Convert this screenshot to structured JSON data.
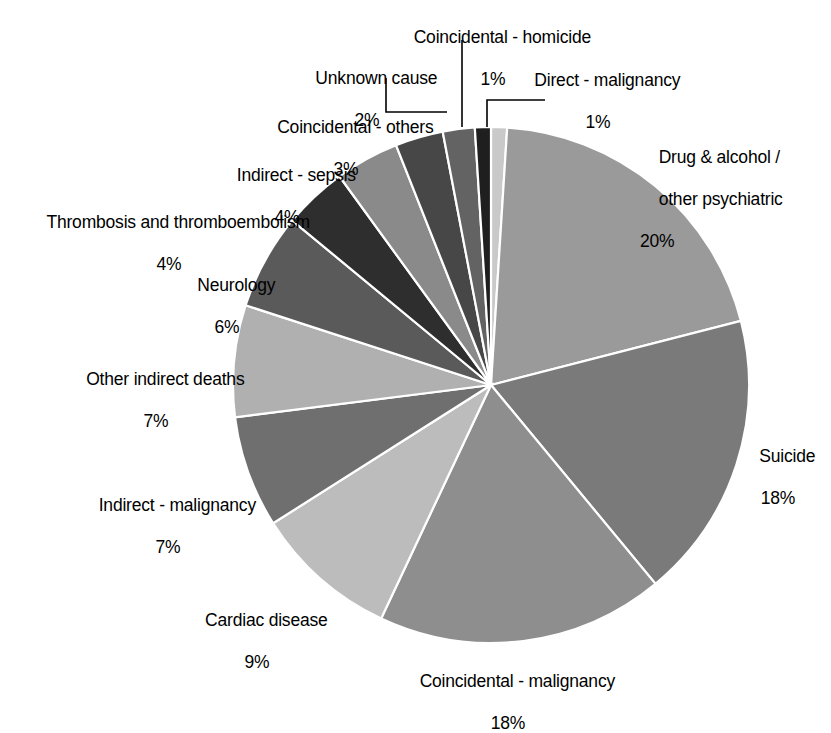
{
  "chart_data": {
    "type": "pie",
    "title": "",
    "legend_position": "none",
    "grid": false,
    "unit": "%",
    "total": 100,
    "start_angle_deg": 0,
    "direction": "clockwise",
    "categories": [
      "Direct - malignancy",
      "Drug & alcohol / other psychiatric",
      "Suicide",
      "Coincidental - malignancy",
      "Cardiac disease",
      "Indirect - malignancy",
      "Other indirect deaths",
      "Neurology",
      "Thrombosis and thromboembolism",
      "Indirect - sepsis",
      "Coincidental - others",
      "Unknown cause",
      "Coincidental - homicide"
    ],
    "values": [
      1,
      20,
      18,
      18,
      9,
      7,
      7,
      6,
      4,
      4,
      3,
      2,
      1
    ],
    "colors": [
      "#c9c9c9",
      "#9a9a9a",
      "#7a7a7a",
      "#8e8e8e",
      "#bcbcbc",
      "#6f6f6f",
      "#b0b0b0",
      "#5a5a5a",
      "#2e2e2e",
      "#8a8a8a",
      "#474747",
      "#636363",
      "#1f1f1f"
    ],
    "slice_labels": [
      {
        "name": "Direct - malignancy",
        "value": 1,
        "text": "Direct - malignancy",
        "pct": "1%"
      },
      {
        "name": "Drug & alcohol / other psychiatric",
        "value": 20,
        "text": "Drug & alcohol /\nother psychiatric",
        "pct": "20%"
      },
      {
        "name": "Suicide",
        "value": 18,
        "text": "Suicide",
        "pct": "18%"
      },
      {
        "name": "Coincidental - malignancy",
        "value": 18,
        "text": "Coincidental - malignancy",
        "pct": "18%"
      },
      {
        "name": "Cardiac disease",
        "value": 9,
        "text": "Cardiac disease",
        "pct": "9%"
      },
      {
        "name": "Indirect - malignancy",
        "value": 7,
        "text": "Indirect - malignancy",
        "pct": "7%"
      },
      {
        "name": "Other indirect deaths",
        "value": 7,
        "text": "Other indirect deaths",
        "pct": "7%"
      },
      {
        "name": "Neurology",
        "value": 6,
        "text": "Neurology",
        "pct": "6%"
      },
      {
        "name": "Thrombosis and thromboembolism",
        "value": 4,
        "text": "Thrombosis and thromboembolism",
        "pct": "4%"
      },
      {
        "name": "Indirect - sepsis",
        "value": 4,
        "text": "Indirect - sepsis",
        "pct": "4%"
      },
      {
        "name": "Coincidental - others",
        "value": 3,
        "text": "Coincidental - others",
        "pct": "3%"
      },
      {
        "name": "Unknown cause",
        "value": 2,
        "text": "Unknown cause",
        "pct": "2%"
      },
      {
        "name": "Coincidental - homicide",
        "value": 1,
        "text": "Coincidental - homicide",
        "pct": "1%"
      }
    ]
  },
  "labels": {
    "coincidental_homicide": {
      "text": "Coincidental - homicide",
      "pct": "1%"
    },
    "direct_malignancy": {
      "text": "Direct - malignancy",
      "pct": "1%"
    },
    "unknown_cause": {
      "text": "Unknown cause",
      "pct": "2%"
    },
    "coincidental_others": {
      "text": "Coincidental - others",
      "pct": "3%"
    },
    "indirect_sepsis": {
      "text": "Indirect - sepsis",
      "pct": "4%"
    },
    "thrombosis": {
      "text": "Thrombosis and thromboembolism",
      "pct": "4%"
    },
    "neurology": {
      "text": "Neurology",
      "pct": "6%"
    },
    "other_indirect_deaths": {
      "text": "Other indirect deaths",
      "pct": "7%"
    },
    "indirect_malignancy": {
      "text": "Indirect - malignancy",
      "pct": "7%"
    },
    "cardiac_disease": {
      "text": "Cardiac disease",
      "pct": "9%"
    },
    "coincidental_malignancy": {
      "text": "Coincidental - malignancy",
      "pct": "18%"
    },
    "suicide": {
      "text": "Suicide",
      "pct": "18%"
    },
    "drug_alcohol": {
      "text_line1": "Drug & alcohol /",
      "text_line2": "other psychiatric",
      "pct": "20%"
    }
  }
}
